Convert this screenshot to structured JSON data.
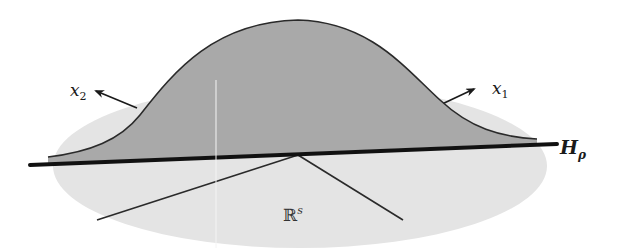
{
  "figure": {
    "colors": {
      "background": "#ffffff",
      "plane_fill": "#e4e4e4",
      "bell_fill": "#a9a9a9",
      "bell_outline": "#2a2a2a",
      "hyperplane_line": "#111111",
      "axis_lines": "#2a2a2a",
      "artifact_line": "#f4f4f4"
    },
    "labels": {
      "x2": {
        "base": "x",
        "sub": "2"
      },
      "x1": {
        "base": "x",
        "sub": "1"
      },
      "hyperplane": {
        "base": "H",
        "sub": "ρ"
      },
      "space": {
        "base": "ℝ",
        "sup": "s"
      }
    },
    "elements": {
      "plane": {
        "shape": "ellipse",
        "cx": 300,
        "cy": 166,
        "rx": 247,
        "ry": 82
      },
      "hyperplane_line": {
        "x1": 30,
        "y1": 165,
        "x2": 557,
        "y2": 144,
        "stroke_width": 4
      },
      "bell_curve": {
        "start": [
          48,
          157
        ],
        "peak": [
          298,
          20
        ],
        "end": [
          537,
          139
        ]
      },
      "axis_origin": [
        298,
        155
      ],
      "lower_left_line": {
        "to": [
          97,
          220
        ]
      },
      "lower_right_line": {
        "to": [
          403,
          220
        ]
      },
      "x2_arrow": {
        "from": [
          137,
          108
        ],
        "to": [
          95,
          91
        ]
      },
      "x1_arrow": {
        "from": [
          440,
          105
        ],
        "to": [
          475,
          89
        ]
      },
      "artifact_vertical_line_x": 216
    }
  }
}
